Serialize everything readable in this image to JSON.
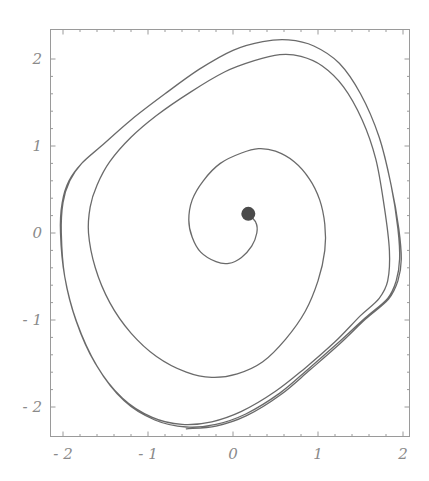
{
  "chart_data": {
    "type": "line",
    "title": "",
    "xlabel": "",
    "ylabel": "",
    "xlim": [
      -2.1,
      2.1
    ],
    "ylim": [
      -2.35,
      2.35
    ],
    "grid": false,
    "legend": null,
    "x_ticks": [
      -2,
      -1,
      0,
      1,
      2
    ],
    "y_ticks": [
      -2,
      -1,
      0,
      1,
      2
    ],
    "x_tick_labels": [
      "-2",
      "-1",
      "0",
      "1",
      "2"
    ],
    "y_tick_labels": [
      "-2",
      "-1",
      "0",
      "1",
      "2"
    ],
    "colors": {
      "curve": "#6a6a6a",
      "frame": "#9a9a9a",
      "dot": "#4a4a4a",
      "labels": "#8a8a8a"
    },
    "initial_point": {
      "x": 0.18,
      "y": 0.22,
      "marker": "filled-circle"
    },
    "series": [
      {
        "name": "trajectory (phase portrait spiralling to limit cycle)",
        "points": [
          [
            0.18,
            0.22
          ],
          [
            0.27,
            0.12
          ],
          [
            0.28,
            0.0
          ],
          [
            0.22,
            -0.15
          ],
          [
            0.1,
            -0.28
          ],
          [
            -0.05,
            -0.35
          ],
          [
            -0.2,
            -0.33
          ],
          [
            -0.38,
            -0.22
          ],
          [
            -0.48,
            -0.05
          ],
          [
            -0.52,
            0.15
          ],
          [
            -0.48,
            0.38
          ],
          [
            -0.35,
            0.6
          ],
          [
            -0.15,
            0.8
          ],
          [
            0.1,
            0.92
          ],
          [
            0.3,
            0.97
          ],
          [
            0.5,
            0.94
          ],
          [
            0.72,
            0.82
          ],
          [
            0.9,
            0.62
          ],
          [
            1.02,
            0.38
          ],
          [
            1.08,
            0.1
          ],
          [
            1.08,
            -0.2
          ],
          [
            1.0,
            -0.55
          ],
          [
            0.85,
            -0.9
          ],
          [
            0.62,
            -1.22
          ],
          [
            0.35,
            -1.48
          ],
          [
            0.05,
            -1.62
          ],
          [
            -0.25,
            -1.66
          ],
          [
            -0.55,
            -1.6
          ],
          [
            -0.9,
            -1.42
          ],
          [
            -1.2,
            -1.15
          ],
          [
            -1.45,
            -0.8
          ],
          [
            -1.62,
            -0.4
          ],
          [
            -1.7,
            0.0
          ],
          [
            -1.68,
            0.3
          ],
          [
            -1.6,
            0.55
          ],
          [
            -1.45,
            0.82
          ],
          [
            -1.2,
            1.1
          ],
          [
            -0.9,
            1.35
          ],
          [
            -0.5,
            1.62
          ],
          [
            -0.1,
            1.85
          ],
          [
            0.25,
            1.98
          ],
          [
            0.55,
            2.05
          ],
          [
            0.8,
            2.03
          ],
          [
            1.05,
            1.92
          ],
          [
            1.3,
            1.68
          ],
          [
            1.52,
            1.3
          ],
          [
            1.68,
            0.85
          ],
          [
            1.78,
            0.3
          ],
          [
            1.84,
            -0.2
          ],
          [
            1.82,
            -0.55
          ],
          [
            1.72,
            -0.75
          ],
          [
            1.5,
            -0.95
          ],
          [
            1.2,
            -1.25
          ],
          [
            0.85,
            -1.55
          ],
          [
            0.5,
            -1.82
          ],
          [
            0.1,
            -2.05
          ],
          [
            -0.25,
            -2.17
          ],
          [
            -0.6,
            -2.2
          ],
          [
            -0.95,
            -2.12
          ],
          [
            -1.3,
            -1.9
          ],
          [
            -1.62,
            -1.5
          ],
          [
            -1.85,
            -1.0
          ],
          [
            -1.98,
            -0.5
          ],
          [
            -2.02,
            0.0
          ],
          [
            -2.0,
            0.35
          ],
          [
            -1.92,
            0.6
          ],
          [
            -1.78,
            0.8
          ],
          [
            -1.55,
            1.0
          ],
          [
            -1.2,
            1.3
          ],
          [
            -0.8,
            1.6
          ],
          [
            -0.4,
            1.88
          ],
          [
            0.0,
            2.1
          ],
          [
            0.35,
            2.2
          ],
          [
            0.65,
            2.22
          ],
          [
            0.95,
            2.15
          ],
          [
            1.25,
            1.95
          ],
          [
            1.5,
            1.6
          ],
          [
            1.72,
            1.1
          ],
          [
            1.86,
            0.55
          ],
          [
            1.94,
            0.05
          ],
          [
            1.96,
            -0.3
          ],
          [
            1.92,
            -0.55
          ],
          [
            1.82,
            -0.75
          ],
          [
            1.55,
            -0.98
          ],
          [
            1.25,
            -1.25
          ],
          [
            0.9,
            -1.55
          ],
          [
            0.55,
            -1.84
          ],
          [
            0.15,
            -2.08
          ],
          [
            -0.2,
            -2.2
          ],
          [
            -0.55,
            -2.23
          ],
          [
            -0.92,
            -2.15
          ],
          [
            -1.28,
            -1.93
          ],
          [
            -1.6,
            -1.53
          ],
          [
            -1.84,
            -1.02
          ],
          [
            -1.98,
            -0.5
          ],
          [
            -2.03,
            0.0
          ],
          [
            -2.01,
            0.35
          ],
          [
            -1.93,
            0.6
          ],
          [
            -1.78,
            0.8
          ],
          [
            -1.55,
            1.0
          ],
          [
            -1.2,
            1.3
          ],
          [
            -0.8,
            1.6
          ],
          [
            -0.4,
            1.88
          ],
          [
            0.0,
            2.1
          ],
          [
            0.35,
            2.2
          ],
          [
            0.65,
            2.22
          ],
          [
            0.95,
            2.15
          ],
          [
            1.25,
            1.95
          ],
          [
            1.5,
            1.6
          ],
          [
            1.72,
            1.1
          ],
          [
            1.86,
            0.55
          ],
          [
            1.95,
            0.05
          ],
          [
            1.98,
            -0.3
          ],
          [
            1.94,
            -0.55
          ],
          [
            1.83,
            -0.76
          ],
          [
            1.56,
            -0.99
          ],
          [
            1.26,
            -1.27
          ],
          [
            0.91,
            -1.57
          ],
          [
            0.56,
            -1.86
          ],
          [
            0.16,
            -2.1
          ],
          [
            -0.2,
            -2.22
          ],
          [
            -0.55,
            -2.25
          ]
        ]
      }
    ]
  }
}
